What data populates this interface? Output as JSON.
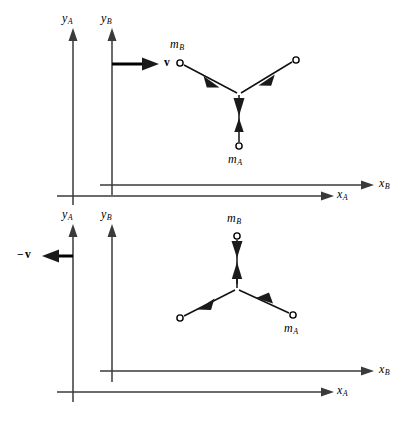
{
  "figure": {
    "background_color": "#ffffff",
    "axis_color": "#3a3a3a",
    "vector_color": "#111111",
    "panels": [
      {
        "id": "top",
        "name": "frame-view-top",
        "axes": [
          {
            "name": "y-axis-A",
            "label_var": "y",
            "label_sub": "A"
          },
          {
            "name": "y-axis-B",
            "label_var": "y",
            "label_sub": "B"
          },
          {
            "name": "x-axis-A",
            "label_var": "x",
            "label_sub": "A"
          },
          {
            "name": "x-axis-B",
            "label_var": "x",
            "label_sub": "B"
          }
        ],
        "velocity": {
          "name": "velocity-vector-v",
          "label": "v",
          "sign": "",
          "direction": "right"
        },
        "particles": [
          {
            "name": "particle-mB",
            "label_var": "m",
            "label_sub": "B",
            "labeled": true
          },
          {
            "name": "particle-right-unlabeled",
            "label_var": "",
            "label_sub": "",
            "labeled": false
          },
          {
            "name": "particle-mA",
            "label_var": "m",
            "label_sub": "A",
            "labeled": true
          }
        ]
      },
      {
        "id": "bottom",
        "name": "frame-view-bottom",
        "axes": [
          {
            "name": "y-axis-A",
            "label_var": "y",
            "label_sub": "A"
          },
          {
            "name": "y-axis-B",
            "label_var": "y",
            "label_sub": "B"
          },
          {
            "name": "x-axis-A",
            "label_var": "x",
            "label_sub": "A"
          },
          {
            "name": "x-axis-B",
            "label_var": "x",
            "label_sub": "B"
          }
        ],
        "velocity": {
          "name": "velocity-vector-minus-v",
          "label": "v",
          "sign": "−",
          "direction": "left"
        },
        "particles": [
          {
            "name": "particle-mB",
            "label_var": "m",
            "label_sub": "B",
            "labeled": true
          },
          {
            "name": "particle-left-unlabeled",
            "label_var": "",
            "label_sub": "",
            "labeled": false
          },
          {
            "name": "particle-mA",
            "label_var": "m",
            "label_sub": "A",
            "labeled": true
          }
        ]
      }
    ],
    "labels": {
      "top": {
        "yA": {
          "var": "y",
          "sub": "A"
        },
        "yB": {
          "var": "y",
          "sub": "B"
        },
        "xA": {
          "var": "x",
          "sub": "A"
        },
        "xB": {
          "var": "x",
          "sub": "B"
        },
        "v": "v",
        "mB": {
          "var": "m",
          "sub": "B"
        },
        "mA": {
          "var": "m",
          "sub": "A"
        }
      },
      "bottom": {
        "yA": {
          "var": "y",
          "sub": "A"
        },
        "yB": {
          "var": "y",
          "sub": "B"
        },
        "xA": {
          "var": "x",
          "sub": "A"
        },
        "xB": {
          "var": "x",
          "sub": "B"
        },
        "minus_v_sign": "−",
        "v": "v",
        "mB": {
          "var": "m",
          "sub": "B"
        },
        "mA": {
          "var": "m",
          "sub": "A"
        }
      }
    }
  }
}
